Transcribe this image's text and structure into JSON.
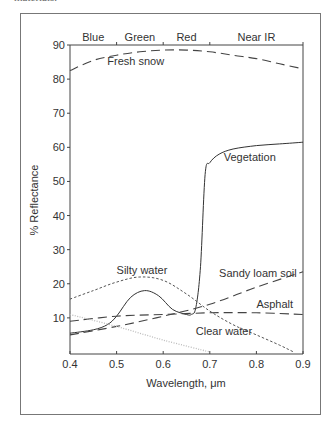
{
  "caption_fragment": "materials.",
  "chart_data": {
    "type": "line",
    "title": "",
    "xlabel": "Wavelength, μm",
    "ylabel": "% Reflectance",
    "xlim": [
      0.4,
      0.9
    ],
    "ylim": [
      0,
      90
    ],
    "xticks": [
      "0.4",
      "0.5",
      "0.6",
      "0.7",
      "0.8",
      "0.9"
    ],
    "yticks": [
      "10",
      "20",
      "30",
      "40",
      "50",
      "60",
      "70",
      "80",
      "90"
    ],
    "grid": false,
    "band_labels": [
      {
        "label": "Blue",
        "from": 0.4,
        "to": 0.5
      },
      {
        "label": "Green",
        "from": 0.5,
        "to": 0.6
      },
      {
        "label": "Red",
        "from": 0.6,
        "to": 0.7
      },
      {
        "label": "Near IR",
        "from": 0.7,
        "to": 0.9
      }
    ],
    "series": [
      {
        "name": "Fresh snow",
        "style": "long-dash",
        "x": [
          0.4,
          0.45,
          0.5,
          0.55,
          0.6,
          0.65,
          0.7,
          0.75,
          0.8,
          0.85,
          0.9
        ],
        "values": [
          82.5,
          85.5,
          87,
          88,
          88.5,
          88.5,
          88,
          87,
          86,
          84.5,
          83
        ]
      },
      {
        "name": "Vegetation",
        "style": "solid",
        "x": [
          0.4,
          0.45,
          0.48,
          0.5,
          0.53,
          0.56,
          0.59,
          0.62,
          0.65,
          0.66,
          0.67,
          0.68,
          0.69,
          0.7,
          0.72,
          0.75,
          0.8,
          0.85,
          0.9
        ],
        "values": [
          5.5,
          6.5,
          8,
          10.5,
          16,
          18,
          16.5,
          12.5,
          11,
          11,
          13,
          25,
          52,
          55.5,
          58,
          59.5,
          60.5,
          61,
          61.5
        ]
      },
      {
        "name": "Silty water",
        "style": "short-dash",
        "x": [
          0.4,
          0.45,
          0.5,
          0.55,
          0.6,
          0.65,
          0.7,
          0.75,
          0.8,
          0.85,
          0.88
        ],
        "values": [
          15.5,
          18,
          20.5,
          22,
          21,
          17,
          12,
          8,
          5,
          2,
          0
        ]
      },
      {
        "name": "Sandy loam soil",
        "style": "long-dash",
        "x": [
          0.4,
          0.5,
          0.6,
          0.7,
          0.8,
          0.9
        ],
        "values": [
          5,
          7.5,
          10.5,
          14,
          19,
          23.5
        ]
      },
      {
        "name": "Asphalt",
        "style": "long-dash",
        "x": [
          0.4,
          0.5,
          0.6,
          0.7,
          0.8,
          0.9
        ],
        "values": [
          9,
          10.5,
          11,
          11.5,
          11.5,
          11
        ]
      },
      {
        "name": "Clear water",
        "style": "dotted",
        "x": [
          0.4,
          0.5,
          0.6,
          0.7
        ],
        "values": [
          11,
          7.5,
          3.5,
          0
        ]
      }
    ],
    "annotations": [
      {
        "text": "Fresh snow",
        "x": 0.48,
        "y": 84
      },
      {
        "text": "Vegetation",
        "x": 0.73,
        "y": 56
      },
      {
        "text": "Silty water",
        "x": 0.5,
        "y": 23
      },
      {
        "text": "Sandy loam soil",
        "x": 0.72,
        "y": 22
      },
      {
        "text": "Asphalt",
        "x": 0.8,
        "y": 13
      },
      {
        "text": "Clear water",
        "x": 0.67,
        "y": 5
      }
    ]
  }
}
